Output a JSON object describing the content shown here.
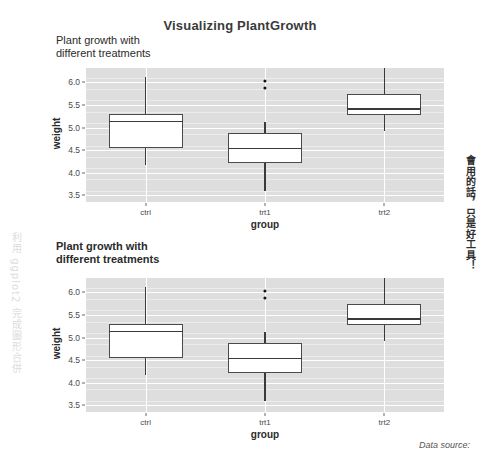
{
  "main_title": "Visualizing PlantGrowth",
  "footer": {
    "data_source": "Data source:"
  },
  "watermarks": {
    "left": "利用 ggplot2 完成圖形合併",
    "right": "會用的話，只是好工具！"
  },
  "chart_data": [
    {
      "id": "top",
      "type": "boxplot",
      "title": "Plant growth with\ndifferent treatments",
      "title_bold": false,
      "xlabel": "group",
      "ylabel": "weight",
      "categories": [
        "ctrl",
        "trt1",
        "trt2"
      ],
      "ylim": [
        3.35,
        6.32
      ],
      "yticks": [
        3.5,
        4.0,
        4.5,
        5.0,
        5.5,
        6.0
      ],
      "ytick_labels": [
        "3.5",
        "4.0",
        "4.5",
        "5.0",
        "5.5",
        "6.0"
      ],
      "grid": true,
      "boxes": [
        {
          "name": "ctrl",
          "min": 4.17,
          "q1": 4.55,
          "median": 5.155,
          "q3": 5.29,
          "max": 6.11,
          "outliers": []
        },
        {
          "name": "trt1",
          "min": 3.59,
          "q1": 4.21,
          "median": 4.55,
          "q3": 4.87,
          "max": 5.12,
          "outliers": [
            6.03,
            5.87
          ]
        },
        {
          "name": "trt2",
          "min": 4.92,
          "q1": 5.27,
          "median": 5.435,
          "q3": 5.735,
          "max": 6.31,
          "outliers": []
        }
      ]
    },
    {
      "id": "bottom",
      "type": "boxplot",
      "title": "Plant growth with\ndifferent treatments",
      "title_bold": true,
      "xlabel": "group",
      "ylabel": "weight",
      "categories": [
        "ctrl",
        "trt1",
        "trt2"
      ],
      "ylim": [
        3.35,
        6.32
      ],
      "yticks": [
        3.5,
        4.0,
        4.5,
        5.0,
        5.5,
        6.0
      ],
      "ytick_labels": [
        "3.5",
        "4.0",
        "4.5",
        "5.0",
        "5.5",
        "6.0"
      ],
      "grid": true,
      "boxes": [
        {
          "name": "ctrl",
          "min": 4.17,
          "q1": 4.55,
          "median": 5.155,
          "q3": 5.29,
          "max": 6.11,
          "outliers": []
        },
        {
          "name": "trt1",
          "min": 3.59,
          "q1": 4.21,
          "median": 4.55,
          "q3": 4.87,
          "max": 5.12,
          "outliers": [
            6.03,
            5.87
          ]
        },
        {
          "name": "trt2",
          "min": 4.92,
          "q1": 5.27,
          "median": 5.435,
          "q3": 5.735,
          "max": 6.31,
          "outliers": []
        }
      ]
    }
  ],
  "layout": {
    "top": {
      "x": 56,
      "y": 34,
      "panel": {
        "left": 30,
        "top": 34,
        "width": 358,
        "height": 134
      }
    },
    "bottom": {
      "x": 56,
      "y": 240,
      "panel": {
        "left": 30,
        "top": 38,
        "width": 358,
        "height": 134
      }
    }
  }
}
